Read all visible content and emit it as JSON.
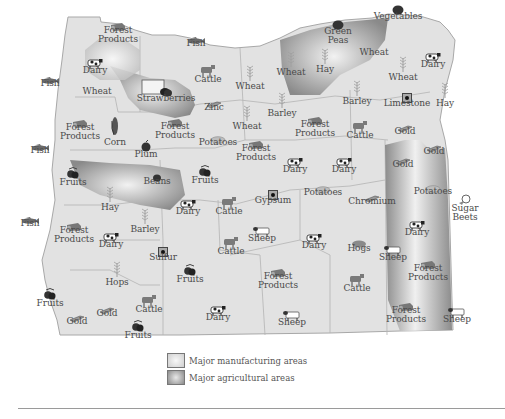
{
  "map": {
    "title": "Oregon products and resources",
    "colors": {
      "land": "#e2e2e2",
      "border": "#a8a8a8",
      "manufacturing_area": "#d0d0d0",
      "agricultural_area": "#8e8e8e",
      "label_text": "#4a4a4a"
    },
    "labels": [
      {
        "id": "forest-products-nw",
        "text": "Forest\nProducts",
        "x": 118,
        "y": 36,
        "icon": "lumber-icon"
      },
      {
        "id": "fish-columbia",
        "text": "Fish",
        "x": 196,
        "y": 44,
        "icon": "fish-icon"
      },
      {
        "id": "fish-nw",
        "text": "Fish",
        "x": 50,
        "y": 84,
        "icon": "fish-icon"
      },
      {
        "id": "dairy-tillamook",
        "text": "Dairy",
        "x": 95,
        "y": 71,
        "icon": "cow-icon"
      },
      {
        "id": "wheat-nw",
        "text": "Wheat",
        "x": 97,
        "y": 92,
        "icon": null
      },
      {
        "id": "cattle-n",
        "text": "Cattle",
        "x": 208,
        "y": 80,
        "icon": "cattle-icon"
      },
      {
        "id": "strawberries",
        "text": "Strawberries",
        "x": 166,
        "y": 99,
        "icon": "strawberry-icon"
      },
      {
        "id": "zinc",
        "text": "Zinc",
        "x": 214,
        "y": 108,
        "icon": "metal-bar-icon"
      },
      {
        "id": "wheat-n1",
        "text": "Wheat",
        "x": 250,
        "y": 87,
        "icon": "wheat-icon"
      },
      {
        "id": "forest-products-coast",
        "text": "Forest\nProducts",
        "x": 80,
        "y": 133,
        "icon": "lumber-icon"
      },
      {
        "id": "fish-mid",
        "text": "Fish",
        "x": 40,
        "y": 151,
        "icon": "fish-icon"
      },
      {
        "id": "corn",
        "text": "Corn",
        "x": 115,
        "y": 143,
        "icon": "corn-icon"
      },
      {
        "id": "forest-products-valley",
        "text": "Forest\nProducts",
        "x": 175,
        "y": 132,
        "icon": "lumber-icon"
      },
      {
        "id": "plum",
        "text": "Plum",
        "x": 146,
        "y": 155,
        "icon": "plum-icon"
      },
      {
        "id": "potatoes-n",
        "text": "Potatoes",
        "x": 218,
        "y": 143,
        "icon": "potato-icon"
      },
      {
        "id": "wheat-n2",
        "text": "Wheat",
        "x": 247,
        "y": 127,
        "icon": "wheat-icon"
      },
      {
        "id": "barley-n",
        "text": "Barley",
        "x": 282,
        "y": 114,
        "icon": "wheat-icon"
      },
      {
        "id": "forest-products-c",
        "text": "Forest\nProducts",
        "x": 315,
        "y": 130,
        "icon": "lumber-icon"
      },
      {
        "id": "cattle-c",
        "text": "Cattle",
        "x": 360,
        "y": 136,
        "icon": "cattle-icon"
      },
      {
        "id": "green-peas",
        "text": "Green\nPeas",
        "x": 338,
        "y": 37,
        "icon": "peas-icon"
      },
      {
        "id": "vegetables",
        "text": "Vegetables",
        "x": 398,
        "y": 17,
        "icon": "vegetable-icon"
      },
      {
        "id": "wheat-ne1",
        "text": "Wheat",
        "x": 291,
        "y": 73,
        "icon": "wheat-icon"
      },
      {
        "id": "hay-ne",
        "text": "Hay",
        "x": 325,
        "y": 70,
        "icon": "wheat-icon"
      },
      {
        "id": "wheat-ne2",
        "text": "Wheat",
        "x": 374,
        "y": 53,
        "icon": null
      },
      {
        "id": "dairy-ne",
        "text": "Dairy",
        "x": 433,
        "y": 65,
        "icon": "cow-icon"
      },
      {
        "id": "wheat-ne3",
        "text": "Wheat",
        "x": 403,
        "y": 78,
        "icon": "wheat-icon"
      },
      {
        "id": "barley-ne",
        "text": "Barley",
        "x": 357,
        "y": 102,
        "icon": "wheat-icon"
      },
      {
        "id": "limestone",
        "text": "Limestone",
        "x": 407,
        "y": 104,
        "icon": "mineral-icon"
      },
      {
        "id": "hay-far-ne",
        "text": "Hay",
        "x": 445,
        "y": 104,
        "icon": "wheat-icon"
      },
      {
        "id": "gold-ne",
        "text": "Gold",
        "x": 405,
        "y": 132,
        "icon": "metal-bar-icon"
      },
      {
        "id": "gold-e1",
        "text": "Gold",
        "x": 434,
        "y": 152,
        "icon": "metal-bar-icon"
      },
      {
        "id": "gold-e2",
        "text": "Gold",
        "x": 403,
        "y": 165,
        "icon": "metal-bar-icon"
      },
      {
        "id": "fruits-w",
        "text": "Fruits",
        "x": 73,
        "y": 183,
        "icon": "fruit-icon"
      },
      {
        "id": "beans",
        "text": "Beans",
        "x": 157,
        "y": 182,
        "icon": "bean-icon"
      },
      {
        "id": "fruits-hood",
        "text": "Fruits",
        "x": 205,
        "y": 181,
        "icon": "fruit-icon"
      },
      {
        "id": "forest-products-cc",
        "text": "Forest\nProducts",
        "x": 256,
        "y": 154,
        "icon": "lumber-icon"
      },
      {
        "id": "dairy-c1",
        "text": "Dairy",
        "x": 295,
        "y": 170,
        "icon": "cow-icon"
      },
      {
        "id": "dairy-c2",
        "text": "Dairy",
        "x": 344,
        "y": 170,
        "icon": "cow-icon"
      },
      {
        "id": "hay-valley",
        "text": "Hay",
        "x": 110,
        "y": 208,
        "icon": "wheat-icon"
      },
      {
        "id": "dairy-v",
        "text": "Dairy",
        "x": 188,
        "y": 212,
        "icon": "cow-icon"
      },
      {
        "id": "cattle-v",
        "text": "Cattle",
        "x": 229,
        "y": 212,
        "icon": "cattle-icon"
      },
      {
        "id": "gypsum",
        "text": "Gypsum",
        "x": 273,
        "y": 201,
        "icon": "mineral-icon"
      },
      {
        "id": "potatoes-c",
        "text": "Potatoes",
        "x": 323,
        "y": 193,
        "icon": "potato-icon"
      },
      {
        "id": "chromium",
        "text": "Chromium",
        "x": 372,
        "y": 202,
        "icon": "metal-bar-icon"
      },
      {
        "id": "potatoes-e",
        "text": "Potatoes",
        "x": 433,
        "y": 192,
        "icon": "potato-icon"
      },
      {
        "id": "sugar-beets",
        "text": "Sugar\nBeets",
        "x": 465,
        "y": 214,
        "icon": "sugar-beet-icon"
      },
      {
        "id": "fish-sw",
        "text": "Fish",
        "x": 30,
        "y": 224,
        "icon": "fish-icon"
      },
      {
        "id": "forest-products-sw",
        "text": "Forest\nProducts",
        "x": 74,
        "y": 236,
        "icon": "lumber-icon"
      },
      {
        "id": "barley-v",
        "text": "Barley",
        "x": 145,
        "y": 230,
        "icon": "wheat-icon"
      },
      {
        "id": "dairy-sw",
        "text": "Dairy",
        "x": 111,
        "y": 245,
        "icon": "cow-icon"
      },
      {
        "id": "sulfur",
        "text": "Sulfur",
        "x": 163,
        "y": 258,
        "icon": "mineral-icon"
      },
      {
        "id": "cattle-sc1",
        "text": "Cattle",
        "x": 231,
        "y": 252,
        "icon": "cattle-icon"
      },
      {
        "id": "sheep-sc1",
        "text": "Sheep",
        "x": 262,
        "y": 239,
        "icon": "sheep-icon"
      },
      {
        "id": "dairy-sc",
        "text": "Dairy",
        "x": 314,
        "y": 246,
        "icon": "cow-icon"
      },
      {
        "id": "hogs",
        "text": "Hogs",
        "x": 359,
        "y": 249,
        "icon": "hog-icon"
      },
      {
        "id": "sheep-e",
        "text": "Sheep",
        "x": 393,
        "y": 258,
        "icon": "sheep-icon"
      },
      {
        "id": "dairy-e",
        "text": "Dairy",
        "x": 417,
        "y": 233,
        "icon": "cow-icon"
      },
      {
        "id": "forest-products-se1",
        "text": "Forest\nProducts",
        "x": 428,
        "y": 274,
        "icon": "lumber-icon"
      },
      {
        "id": "hops",
        "text": "Hops",
        "x": 117,
        "y": 283,
        "icon": "wheat-icon"
      },
      {
        "id": "fruits-s",
        "text": "Fruits",
        "x": 190,
        "y": 280,
        "icon": "fruit-icon"
      },
      {
        "id": "forest-products-sc",
        "text": "Forest\nProducts",
        "x": 278,
        "y": 282,
        "icon": "lumber-icon"
      },
      {
        "id": "cattle-se",
        "text": "Cattle",
        "x": 357,
        "y": 289,
        "icon": "cattle-icon"
      },
      {
        "id": "fruits-sw",
        "text": "Fruits",
        "x": 50,
        "y": 304,
        "icon": "fruit-icon"
      },
      {
        "id": "gold-sw1",
        "text": "Gold",
        "x": 77,
        "y": 322,
        "icon": "metal-bar-icon"
      },
      {
        "id": "gold-sw2",
        "text": "Gold",
        "x": 107,
        "y": 314,
        "icon": "metal-bar-icon"
      },
      {
        "id": "cattle-sw",
        "text": "Cattle",
        "x": 149,
        "y": 310,
        "icon": "cattle-icon"
      },
      {
        "id": "fruits-s2",
        "text": "Fruits",
        "x": 138,
        "y": 336,
        "icon": "fruit-icon"
      },
      {
        "id": "dairy-s",
        "text": "Dairy",
        "x": 218,
        "y": 318,
        "icon": "cow-icon"
      },
      {
        "id": "sheep-s",
        "text": "Sheep",
        "x": 292,
        "y": 323,
        "icon": "sheep-icon"
      },
      {
        "id": "forest-products-se2",
        "text": "Forest\nProducts",
        "x": 406,
        "y": 316,
        "icon": "lumber-icon"
      },
      {
        "id": "sheep-se",
        "text": "Sheep",
        "x": 457,
        "y": 320,
        "icon": "sheep-icon"
      }
    ]
  },
  "legend": {
    "items": [
      {
        "label": "Major manufacturing areas",
        "swatch": "manufacturing"
      },
      {
        "label": "Major agricultural areas",
        "swatch": "agricultural"
      }
    ]
  }
}
